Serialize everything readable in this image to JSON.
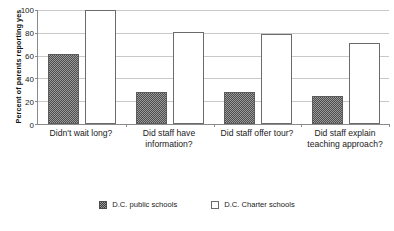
{
  "chart_data": {
    "type": "bar",
    "title": "",
    "xlabel": "",
    "ylabel": "Percent of parents reporting yes",
    "ylim": [
      0,
      100
    ],
    "yticks": [
      0,
      20,
      40,
      60,
      80,
      100
    ],
    "grid": true,
    "legend_position": "bottom",
    "categories": [
      "Didn't wait long?",
      "Did staff have information?",
      "Did staff offer tour?",
      "Did staff explain teaching approach?"
    ],
    "series": [
      {
        "name": "D.C. public schools",
        "fill": "hatched-gray",
        "values": [
          61,
          28,
          28,
          25
        ]
      },
      {
        "name": "D.C. Charter schools",
        "fill": "white",
        "values": [
          100,
          81,
          79,
          71
        ]
      }
    ]
  },
  "axis": {
    "y_title": "Percent of parents reporting yes",
    "y_tick_labels": [
      "100",
      "80",
      "60",
      "40",
      "20",
      "0"
    ]
  },
  "legend": {
    "items": [
      {
        "label": "D.C. public schools"
      },
      {
        "label": "D.C. Charter schools"
      }
    ]
  },
  "colors": {
    "axis": "#8a8a8a",
    "gridline": "#c9c9c9",
    "public_bar": "#4d4d4d",
    "charter_bar": "#ffffff",
    "text": "#1a1a1a"
  }
}
